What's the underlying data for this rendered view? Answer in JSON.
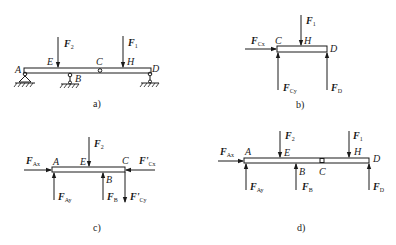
{
  "figure": {
    "panels": [
      {
        "id": "a",
        "caption": "a)",
        "description": "Compound beam with supports at A, B, D and intermediate hinge at C",
        "points": {
          "A": "A",
          "E": "E",
          "B": "B",
          "C": "C",
          "H": "H",
          "D": "D"
        },
        "forces": {
          "F2": {
            "main": "F",
            "sub": "2"
          },
          "F1": {
            "main": "F",
            "sub": "1"
          }
        }
      },
      {
        "id": "b",
        "caption": "b)",
        "description": "Free-body diagram of segment CD",
        "points": {
          "C": "C",
          "H": "H",
          "D": "D"
        },
        "forces": {
          "F1": {
            "main": "F",
            "sub": "1"
          },
          "FCx": {
            "main": "F",
            "sub": "Cx"
          },
          "FCy": {
            "main": "F",
            "sub": "Cy"
          },
          "FD": {
            "main": "F",
            "sub": "D"
          }
        }
      },
      {
        "id": "c",
        "caption": "c)",
        "description": "Free-body diagram of segment AC",
        "points": {
          "A": "A",
          "E": "E",
          "B": "B",
          "C": "C"
        },
        "forces": {
          "F2": {
            "main": "F",
            "sub": "2"
          },
          "FAx": {
            "main": "F",
            "sub": "Ax"
          },
          "FAy": {
            "main": "F",
            "sub": "Ay"
          },
          "FB": {
            "main": "F",
            "sub": "B"
          },
          "FpCx": {
            "main": "F'",
            "sub": "Cx"
          },
          "FpCy": {
            "main": "F'",
            "sub": "Cy"
          }
        }
      },
      {
        "id": "d",
        "caption": "d)",
        "description": "Free-body diagram of whole beam AD",
        "points": {
          "A": "A",
          "E": "E",
          "B": "B",
          "C": "C",
          "H": "H",
          "D": "D"
        },
        "forces": {
          "F2": {
            "main": "F",
            "sub": "2"
          },
          "F1": {
            "main": "F",
            "sub": "1"
          },
          "FAx": {
            "main": "F",
            "sub": "Ax"
          },
          "FAy": {
            "main": "F",
            "sub": "Ay"
          },
          "FB": {
            "main": "F",
            "sub": "B"
          },
          "FD": {
            "main": "F",
            "sub": "D"
          }
        }
      }
    ]
  },
  "colors": {
    "ink": "#1a1a1a",
    "background": "#ffffff"
  }
}
